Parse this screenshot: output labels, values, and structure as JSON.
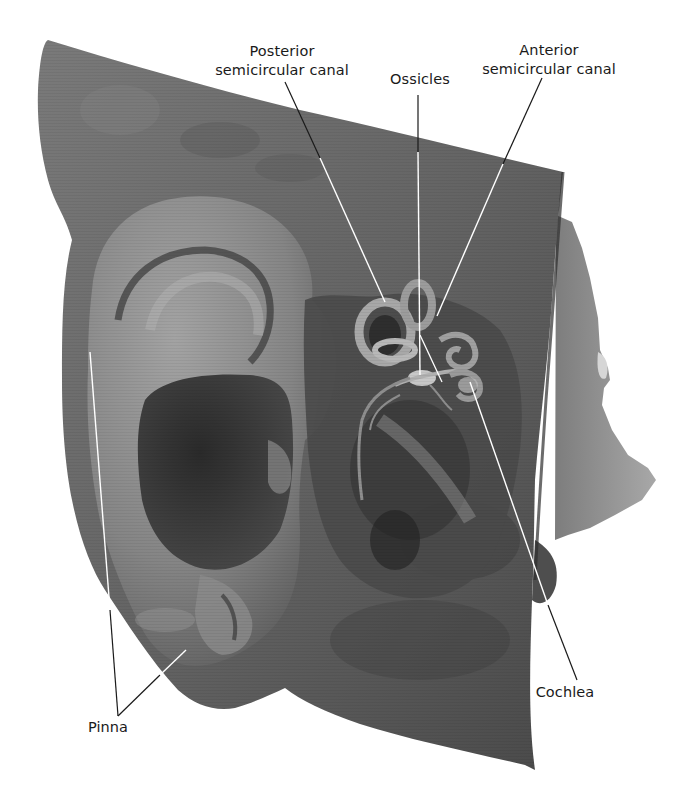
{
  "figure": {
    "background_color": "#ffffff",
    "specimen_color": "#6b6b6b"
  },
  "labels": {
    "posterior_canal": {
      "line1": "Posterior",
      "line2": "semicircular canal"
    },
    "ossicles": {
      "line1": "Ossicles"
    },
    "anterior_canal": {
      "line1": "Anterior",
      "line2": "semicircular canal"
    },
    "pinna": {
      "line1": "Pinna"
    },
    "cochlea": {
      "line1": "Cochlea"
    }
  }
}
